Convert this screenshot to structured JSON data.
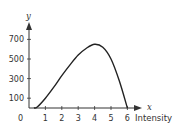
{
  "chart_data": {
    "type": "line",
    "title": "",
    "xlabel": "Intensity",
    "x_axis_letter": "x",
    "ylabel": "y",
    "origin_label": "0",
    "x_ticks": [
      "1",
      "2",
      "3",
      "4",
      "5",
      "6"
    ],
    "y_ticks": [
      "100",
      "300",
      "500",
      "700"
    ],
    "xlim": [
      0,
      6.5
    ],
    "ylim": [
      0,
      800
    ],
    "grid": false,
    "legend": null,
    "series": [
      {
        "name": "y",
        "x": [
          0.3,
          0.5,
          1,
          1.5,
          2,
          2.5,
          3,
          3.5,
          4,
          4.5,
          5,
          5.5,
          6
        ],
        "values": [
          0,
          10,
          100,
          210,
          330,
          440,
          540,
          610,
          650,
          620,
          500,
          280,
          0
        ]
      }
    ],
    "color": "#222222"
  }
}
